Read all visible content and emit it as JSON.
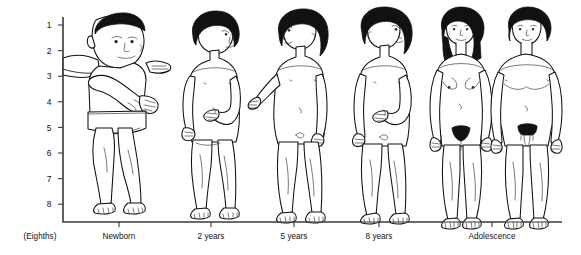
{
  "chart_data": {
    "type": "diagram",
    "title": "",
    "ylabel": "(Eighths)",
    "yticks": [
      "1",
      "2",
      "3",
      "4",
      "5",
      "6",
      "7",
      "8"
    ],
    "ylim": [
      1,
      8
    ],
    "xlabel": "",
    "grid": false,
    "legend": null,
    "categories": [
      "Newborn",
      "2 years",
      "5 years",
      "8 years",
      "Adolescence"
    ],
    "series": [
      {
        "name": "head-height-units (proportion of total body height measured in head lengths)",
        "values": [
          4,
          5,
          6,
          7,
          8
        ]
      }
    ],
    "annotations": [
      "Body proportions expressed in eighths of total stature",
      "Adolescence column shows two figures: female and male"
    ]
  },
  "axis": {
    "unit_label": "(Eighths)",
    "y_ticks": [
      {
        "label": "1",
        "value": 1
      },
      {
        "label": "2",
        "value": 2
      },
      {
        "label": "3",
        "value": 3
      },
      {
        "label": "4",
        "value": 4
      },
      {
        "label": "5",
        "value": 5
      },
      {
        "label": "6",
        "value": 6
      },
      {
        "label": "7",
        "value": 7
      },
      {
        "label": "8",
        "value": 8
      }
    ],
    "x_ticks": [
      {
        "label": "Newborn",
        "x": 119
      },
      {
        "label": "2 years",
        "x": 211
      },
      {
        "label": "5 years",
        "x": 294
      },
      {
        "label": "8 years",
        "x": 379
      },
      {
        "label": "Adolescence",
        "x": 492
      }
    ]
  },
  "figures": [
    {
      "id": "newborn",
      "label": "Newborn",
      "description": "infant held upright by an adult arm"
    },
    {
      "id": "two-years",
      "label": "2 years",
      "description": "toddler standing, dark hair"
    },
    {
      "id": "five-years",
      "label": "5 years",
      "description": "child standing, dark bobbed hair"
    },
    {
      "id": "eight-years",
      "label": "8 years",
      "description": "child standing, dark curly hair"
    },
    {
      "id": "adolescent-female",
      "label": "Adolescence",
      "description": "adolescent female standing"
    },
    {
      "id": "adolescent-male",
      "label": "Adolescence",
      "description": "adolescent male standing"
    }
  ],
  "colors": {
    "background": "#ffffff",
    "ink": "#111111",
    "axis": "#3a3a3a"
  }
}
